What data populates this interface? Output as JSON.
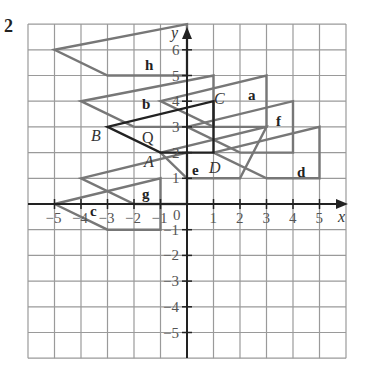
{
  "question_number": "2",
  "axes": {
    "x_label": "x",
    "y_label": "y",
    "origin_label": "0",
    "x_ticks": [
      "−5",
      "−4",
      "−3",
      "−2",
      "−1",
      "1",
      "2",
      "3",
      "4",
      "5"
    ],
    "y_ticks": [
      "6",
      "5",
      "4",
      "3",
      "2",
      "1",
      "−1",
      "−2",
      "−3",
      "−4",
      "−5"
    ]
  },
  "grid": {
    "xmin": -6,
    "xmax": 6,
    "ymin": -6,
    "ymax": 7
  },
  "shapes": [
    {
      "name": "Q",
      "points": [
        [
          -3,
          3
        ],
        [
          1,
          4
        ],
        [
          1,
          2
        ],
        [
          -1,
          2
        ]
      ],
      "dark": true
    },
    {
      "name": "h",
      "points": [
        [
          -5,
          6
        ],
        [
          0,
          7
        ],
        [
          0,
          5
        ],
        [
          -3,
          5
        ]
      ]
    },
    {
      "name": "b",
      "points": [
        [
          -4,
          4
        ],
        [
          1,
          5
        ],
        [
          1,
          3
        ],
        [
          -2,
          3
        ]
      ]
    },
    {
      "name": "a",
      "points": [
        [
          -1,
          4
        ],
        [
          3,
          5
        ],
        [
          3,
          3
        ],
        [
          1,
          3
        ]
      ]
    },
    {
      "name": "f",
      "points": [
        [
          0,
          3
        ],
        [
          4,
          4
        ],
        [
          4,
          2
        ],
        [
          2,
          2
        ]
      ]
    },
    {
      "name": "d",
      "points": [
        [
          1,
          2
        ],
        [
          5,
          3
        ],
        [
          5,
          1
        ],
        [
          3,
          1
        ]
      ]
    },
    {
      "name": "e",
      "points": [
        [
          -1,
          2
        ],
        [
          3,
          3
        ],
        [
          2,
          1
        ],
        [
          0,
          1
        ]
      ]
    },
    {
      "name": "g",
      "points": [
        [
          -4,
          1
        ],
        [
          0,
          2
        ],
        [
          0,
          0
        ],
        [
          -2,
          0
        ]
      ]
    },
    {
      "name": "c",
      "points": [
        [
          -5,
          0
        ],
        [
          -1,
          1
        ],
        [
          -1,
          -1
        ],
        [
          -3,
          -1
        ]
      ]
    }
  ],
  "labels": {
    "a": "a",
    "b": "b",
    "c": "c",
    "d": "d",
    "e": "e",
    "f": "f",
    "g": "g",
    "h": "h",
    "Q": "Q",
    "A": "A",
    "B": "B",
    "C": "C",
    "D": "D"
  }
}
